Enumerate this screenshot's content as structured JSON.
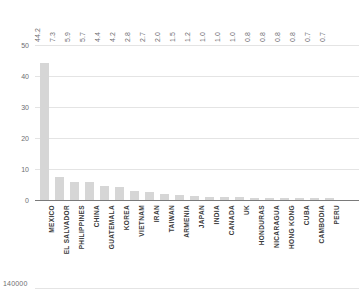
{
  "chart_data": {
    "type": "bar",
    "title": "",
    "subtitle": "",
    "xlabel": "",
    "ylabel": "",
    "ylim": [
      0,
      50
    ],
    "yticks": [
      0,
      10,
      20,
      30,
      40,
      50
    ],
    "grid": true,
    "legend": "none",
    "value_label_format": "one-decimal, rotated 90 degrees above plot",
    "categories": [
      "MEXICO",
      "EL SALVADOR",
      "PHILIPPINES",
      "CHINA",
      "GUATEMALA",
      "KOREA",
      "VIETNAM",
      "IRAN",
      "TAIWAN",
      "ARMENIA",
      "JAPAN",
      "INDIA",
      "CANADA",
      "UK",
      "HONDURAS",
      "NICARAGUA",
      "HONG KONG",
      "CUBA",
      "CAMBODIA",
      "PERU"
    ],
    "values": [
      44.2,
      7.3,
      5.9,
      5.7,
      4.4,
      4.2,
      2.8,
      2.7,
      2.0,
      1.5,
      1.2,
      1.0,
      1.0,
      1.0,
      0.8,
      0.8,
      0.8,
      0.8,
      0.7,
      0.7
    ],
    "value_labels": [
      "44.2",
      "7.3",
      "5.9",
      "5.7",
      "4.4",
      "4.2",
      "2.8",
      "2.7",
      "2.0",
      "1.5",
      "1.2",
      "1.0",
      "1.0",
      "1.0",
      "0.8",
      "0.8",
      "0.8",
      "0.8",
      "0.7",
      "0.7"
    ],
    "bar_color": "#d6d6d6",
    "gridline_color": "#e4e4e4",
    "axis_color": "#7a7a7a"
  },
  "footer": {
    "value": "140000"
  }
}
